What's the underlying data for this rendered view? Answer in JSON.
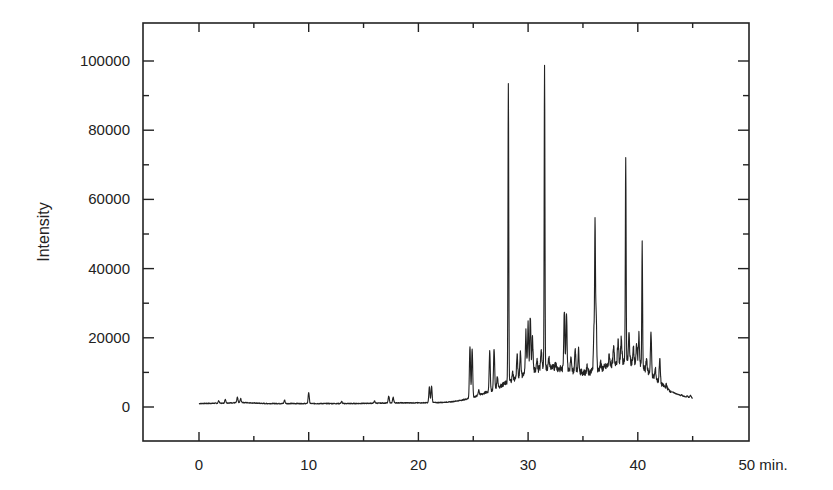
{
  "chart_data": {
    "type": "line",
    "title": "",
    "xlabel": "min.",
    "ylabel": "Intensity",
    "xlim": [
      -5,
      50
    ],
    "ylim": [
      -10000,
      110000
    ],
    "grid": false,
    "legend": null,
    "x_ticks": [
      0,
      10,
      20,
      30,
      40,
      50
    ],
    "x_tick_labels": [
      "0",
      "10",
      "20",
      "30",
      "40",
      "50 min."
    ],
    "y_ticks": [
      0,
      20000,
      40000,
      60000,
      80000,
      100000
    ],
    "y_tick_labels": [
      "0",
      "20000",
      "40000",
      "60000",
      "80000",
      "100000"
    ],
    "series": [
      {
        "name": "chromatogram",
        "color": "#222222",
        "baseline": [
          [
            0,
            1000
          ],
          [
            2,
            1100
          ],
          [
            4,
            1300
          ],
          [
            6,
            1000
          ],
          [
            8,
            1000
          ],
          [
            10,
            1000
          ],
          [
            12,
            1000
          ],
          [
            14,
            1000
          ],
          [
            16,
            1100
          ],
          [
            18,
            1200
          ],
          [
            20,
            1200
          ],
          [
            22,
            1300
          ],
          [
            23,
            1500
          ],
          [
            24,
            2000
          ],
          [
            25,
            2800
          ],
          [
            26,
            4000
          ],
          [
            27,
            5200
          ],
          [
            28,
            7000
          ],
          [
            29,
            8500
          ],
          [
            30,
            10000
          ],
          [
            31,
            11000
          ],
          [
            32,
            11500
          ],
          [
            33,
            11000
          ],
          [
            34,
            10500
          ],
          [
            35,
            10000
          ],
          [
            36,
            10000
          ],
          [
            37,
            11500
          ],
          [
            38,
            13000
          ],
          [
            39,
            13500
          ],
          [
            40,
            12500
          ],
          [
            41,
            10000
          ],
          [
            42,
            7000
          ],
          [
            43,
            4500
          ],
          [
            44,
            3200
          ],
          [
            45,
            2600
          ]
        ],
        "peaks": [
          [
            1.8,
            1800
          ],
          [
            2.4,
            2200
          ],
          [
            3.5,
            2800
          ],
          [
            3.8,
            2400
          ],
          [
            7.8,
            2000
          ],
          [
            10.0,
            4200
          ],
          [
            13.0,
            1600
          ],
          [
            16.0,
            1700
          ],
          [
            17.3,
            3200
          ],
          [
            17.7,
            2800
          ],
          [
            21.0,
            5800
          ],
          [
            21.2,
            6000
          ],
          [
            24.7,
            17500
          ],
          [
            24.9,
            16800
          ],
          [
            25.5,
            5000
          ],
          [
            26.5,
            16000
          ],
          [
            26.9,
            17000
          ],
          [
            27.2,
            9000
          ],
          [
            28.2,
            94000
          ],
          [
            28.6,
            10000
          ],
          [
            29.0,
            15000
          ],
          [
            29.3,
            16000
          ],
          [
            29.8,
            22000
          ],
          [
            30.0,
            24000
          ],
          [
            30.2,
            26000
          ],
          [
            30.4,
            20000
          ],
          [
            30.8,
            14000
          ],
          [
            31.2,
            17000
          ],
          [
            31.5,
            99000
          ],
          [
            31.9,
            14000
          ],
          [
            32.5,
            13000
          ],
          [
            33.3,
            28000
          ],
          [
            33.5,
            27500
          ],
          [
            33.9,
            14000
          ],
          [
            34.3,
            17000
          ],
          [
            34.6,
            16500
          ],
          [
            35.4,
            12000
          ],
          [
            35.8,
            11000
          ],
          [
            36.0,
            22000
          ],
          [
            36.1,
            51000
          ],
          [
            36.2,
            28000
          ],
          [
            36.6,
            13000
          ],
          [
            37.4,
            15000
          ],
          [
            37.8,
            17000
          ],
          [
            38.2,
            19000
          ],
          [
            38.5,
            20000
          ],
          [
            38.9,
            73000
          ],
          [
            39.2,
            21000
          ],
          [
            39.6,
            17000
          ],
          [
            39.9,
            18000
          ],
          [
            40.1,
            21000
          ],
          [
            40.4,
            47000
          ],
          [
            40.8,
            14000
          ],
          [
            41.2,
            21500
          ],
          [
            41.6,
            11000
          ],
          [
            42.0,
            14000
          ],
          [
            42.6,
            6500
          ],
          [
            43.3,
            4000
          ],
          [
            44.0,
            3500
          ],
          [
            44.5,
            3200
          ],
          [
            44.8,
            3400
          ]
        ]
      }
    ]
  }
}
